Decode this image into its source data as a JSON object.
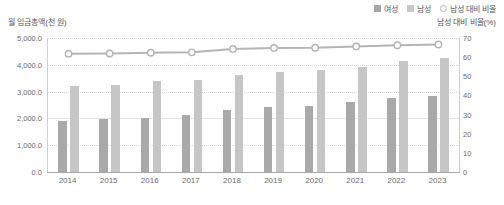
{
  "legend": {
    "items": [
      {
        "label": "여성",
        "marker": "square-swatch-icon",
        "color": "#a9a9a9"
      },
      {
        "label": "남성",
        "marker": "square-swatch-icon",
        "color": "#c6c6c6"
      },
      {
        "label": "남성 대비 비율",
        "marker": "circle-marker-icon",
        "color": "#b5b5b5"
      }
    ]
  },
  "axis_titles": {
    "left": "월 임금총액(천 원)",
    "right": "남성 대비 비율(%)"
  },
  "chart_data": {
    "type": "bar",
    "title": "",
    "xlabel": "",
    "ylabel": "월 임금총액(천 원)",
    "y2label": "남성 대비 비율(%)",
    "categories": [
      "2014",
      "2015",
      "2016",
      "2017",
      "2018",
      "2019",
      "2020",
      "2021",
      "2022",
      "2023"
    ],
    "ylim": [
      0,
      5000
    ],
    "y2lim": [
      0,
      70
    ],
    "ytick_labels": [
      "0.0",
      "1,000.0",
      "2,000.0",
      "3,000.0",
      "4,000.0",
      "5,000.0"
    ],
    "ytick_values": [
      0,
      1000,
      2000,
      3000,
      4000,
      5000
    ],
    "y2tick_labels": [
      "0",
      "10",
      "20",
      "30",
      "40",
      "50",
      "60",
      "70"
    ],
    "y2tick_values": [
      0,
      10,
      20,
      30,
      40,
      50,
      60,
      70
    ],
    "grid": true,
    "legend_position": "top-right",
    "series": [
      {
        "name": "여성",
        "kind": "bar",
        "axis": "left",
        "color": "#a9a9a9",
        "values": [
          1910,
          1975,
          2030,
          2110,
          2300,
          2420,
          2450,
          2600,
          2760,
          2850
        ]
      },
      {
        "name": "남성",
        "kind": "bar",
        "axis": "left",
        "color": "#c6c6c6",
        "values": [
          3210,
          3250,
          3380,
          3450,
          3630,
          3720,
          3800,
          3930,
          4150,
          4250
        ]
      },
      {
        "name": "남성 대비 비율",
        "kind": "line",
        "axis": "right",
        "color": "#b5b5b5",
        "values": [
          61.8,
          61.9,
          62.3,
          62.5,
          64.3,
          64.8,
          64.9,
          65.6,
          66.2,
          66.6
        ]
      }
    ]
  }
}
